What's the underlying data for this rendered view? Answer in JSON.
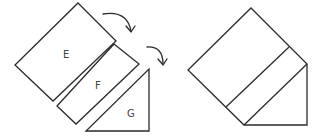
{
  "diagram": {
    "left_group": {
      "pieces": [
        {
          "label": "E",
          "shape": "rectangle"
        },
        {
          "label": "F",
          "shape": "rectangle"
        },
        {
          "label": "G",
          "shape": "right-triangle"
        }
      ],
      "arrows": [
        {
          "name": "arrow-e-to-f",
          "direction": "curved-down-right"
        },
        {
          "name": "arrow-f-to-g",
          "direction": "curved-down-right"
        }
      ]
    },
    "right_group": {
      "description": "Assembled shape composed of E, F and G",
      "labels_shown": false
    },
    "colors": {
      "stroke": "#2a2a2a",
      "background": "#ffffff",
      "label": "#444444"
    }
  }
}
